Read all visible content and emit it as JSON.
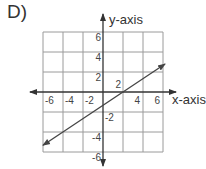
{
  "problem": {
    "label": "D)"
  },
  "chart_data": {
    "type": "line",
    "title": "",
    "xlabel": "x-axis",
    "ylabel": "y-axis",
    "xlim": [
      -6,
      6
    ],
    "ylim": [
      -6,
      6
    ],
    "grid": true,
    "grid_step": 2,
    "x_ticks": [
      {
        "value": -6,
        "label": "-6"
      },
      {
        "value": -4,
        "label": "-4"
      },
      {
        "value": -2,
        "label": "-2"
      },
      {
        "value": 2,
        "label": "2"
      },
      {
        "value": 4,
        "label": "4"
      },
      {
        "value": 6,
        "label": "6"
      }
    ],
    "y_ticks": [
      {
        "value": 6,
        "label": "6"
      },
      {
        "value": 4,
        "label": "4"
      },
      {
        "value": 2,
        "label": "2"
      },
      {
        "value": -2,
        "label": "-2"
      },
      {
        "value": -4,
        "label": "-4"
      },
      {
        "value": -6,
        "label": "-6"
      }
    ],
    "series": [
      {
        "name": "line",
        "equation": "y = (2/3)x - 4/3",
        "slope": 0.6667,
        "intercept": -1.3333,
        "x": [
          -6,
          6.2
        ],
        "y": [
          -5.33,
          2.8
        ],
        "arrows": "both"
      }
    ],
    "colors": {
      "grid": "#9a9a9a",
      "axes": "#333333",
      "line": "#444444"
    }
  }
}
